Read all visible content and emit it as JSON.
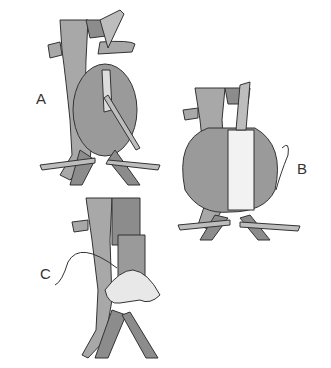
{
  "figure": {
    "panels": [
      {
        "id": "A",
        "label": "A",
        "description": "Aortic aneurysm opened longitudinally with clamps applied"
      },
      {
        "id": "B",
        "label": "B",
        "description": "Tube graft sewn in place inside aneurysm sac"
      },
      {
        "id": "C",
        "label": "C",
        "description": "Aneurysm sac closed over graft with suture"
      }
    ],
    "colors": {
      "vessel": "#a8a8a8",
      "vessel_dark": "#8c8c8c",
      "sac": "#9a9a9a",
      "graft": "#f2f2f2",
      "outline": "#333333",
      "clamp": "#bdbdbd"
    }
  }
}
